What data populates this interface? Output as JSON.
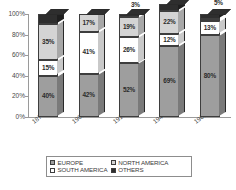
{
  "chart_data": {
    "type": "bar",
    "subtype": "100% stacked column (3D)",
    "title": "",
    "xlabel": "",
    "ylabel": "",
    "ylim": [
      0,
      100
    ],
    "ytick_labels": [
      "100%",
      "80%",
      "60%",
      "40%",
      "20%",
      "0%"
    ],
    "ytick_values": [
      100,
      80,
      60,
      40,
      20,
      0
    ],
    "grid": false,
    "legend_position": "bottom",
    "categories": [
      "1876-1900",
      "1901-1914",
      "1915-1945",
      "1946-1960",
      "1961-1976"
    ],
    "series": [
      {
        "name": "EUROPE",
        "color": "#9e9e9e",
        "values": [
          40,
          42,
          52,
          69,
          80
        ],
        "labels": [
          "40%",
          "42%",
          "52%",
          "69%",
          "80%"
        ]
      },
      {
        "name": "SOUTH AMERICA",
        "color": "#ffffff",
        "values": [
          15,
          41,
          26,
          12,
          13
        ],
        "labels": [
          "15%",
          "41%",
          "26%",
          "12%",
          "13%"
        ]
      },
      {
        "name": "NORTH AMERICA",
        "color": "#d4d4d4",
        "values": [
          35,
          17,
          19,
          22,
          2
        ],
        "labels": [
          "35%",
          "17%",
          "19%",
          "22%",
          "2%"
        ]
      },
      {
        "name": "OTHERS",
        "color": "#2e2e2e",
        "values": [
          10,
          0,
          3,
          7,
          5
        ],
        "labels": [
          "",
          "",
          "3%",
          "7%",
          "5%"
        ]
      }
    ]
  },
  "legend": {
    "items": [
      {
        "label": "EUROPE",
        "color": "#9e9e9e"
      },
      {
        "label": "NORTH AMERICA",
        "color": "#d4d4d4"
      },
      {
        "label": "SOUTH AMERICA",
        "color": "#ffffff"
      },
      {
        "label": "OTHERS",
        "color": "#2e2e2e"
      }
    ]
  }
}
